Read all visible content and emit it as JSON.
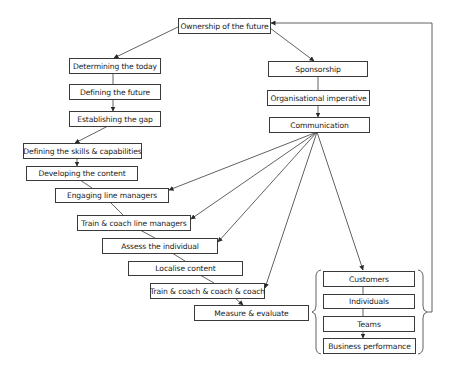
{
  "diagram": {
    "top": "Ownership of the future",
    "left_branch": [
      "Determining the today",
      "Defining the future",
      "Establishing the gap",
      "Defining the skills & capabilities",
      "Developing the content",
      "Engaging line managers",
      "Train & coach line managers",
      "Assess the individual",
      "Localise content",
      "Train & coach & coach & coach",
      "Measure & evaluate"
    ],
    "right_branch": [
      "Sponsorship",
      "Organisational imperative",
      "Communication"
    ],
    "outcomes": [
      "Customers",
      "Individuals",
      "Teams",
      "Business performance"
    ],
    "colors": {
      "line": "#3a3a3a",
      "box_border": "#3a3a3a",
      "background": "#ffffff"
    }
  }
}
